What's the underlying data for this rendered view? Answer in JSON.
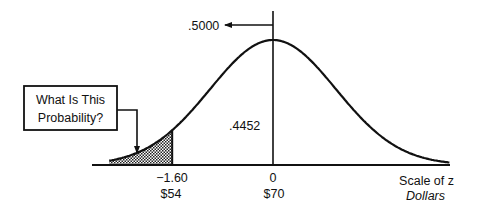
{
  "diagram": {
    "type": "normal-distribution-tail-probability",
    "mean_label": {
      "z": "0",
      "dollars": "$70"
    },
    "cutoff_label": {
      "z": "−1.60",
      "dollars": "$54"
    },
    "half_area_label": ".5000",
    "between_area_label": ".4452",
    "question_box": [
      "What Is This",
      "Probability?"
    ],
    "axis_labels": {
      "z": "Scale of z",
      "dollars": "Dollars"
    },
    "z_range": [
      -2.6,
      2.8
    ],
    "cutoff_z": -1.6,
    "shaded_region": "left tail below z = -1.60",
    "colors": {
      "ink": "#111111",
      "background": "#ffffff"
    }
  }
}
